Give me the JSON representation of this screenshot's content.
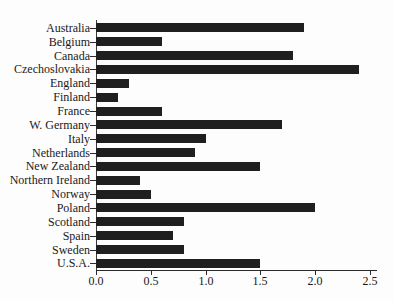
{
  "chart_data": {
    "type": "bar",
    "orientation": "horizontal",
    "title": "",
    "xlabel": "",
    "ylabel": "",
    "categories": [
      "Australia",
      "Belgium",
      "Canada",
      "Czechoslovakia",
      "England",
      "Finland",
      "France",
      "W. Germany",
      "Italy",
      "Netherlands",
      "New Zealand",
      "Northern Ireland",
      "Norway",
      "Poland",
      "Scotland",
      "Spain",
      "Sweden",
      "U.S.A."
    ],
    "values": [
      1.9,
      0.6,
      1.8,
      2.4,
      0.3,
      0.2,
      0.6,
      1.7,
      1.0,
      0.9,
      1.5,
      0.4,
      0.5,
      2.0,
      0.8,
      0.7,
      0.8,
      1.5
    ],
    "xlim": [
      0,
      2.5
    ],
    "x_ticks": [
      "0.0",
      "0.5",
      "1.0",
      "1.5",
      "2.0",
      "2.5"
    ],
    "x_tick_values": [
      0.0,
      0.5,
      1.0,
      1.5,
      2.0,
      2.5
    ],
    "grid": false,
    "legend": null,
    "bar_color": "#1f1f1f",
    "axis_color": "#2a2a2a",
    "text_color": "#191919",
    "background_color": "#fdfdfd"
  }
}
